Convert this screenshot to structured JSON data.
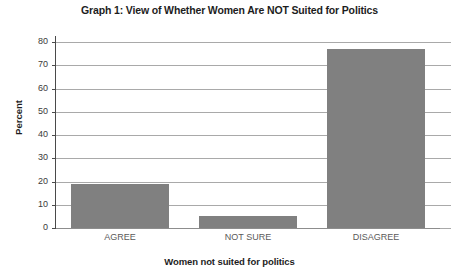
{
  "chart_data": {
    "type": "bar",
    "title": "Graph 1: View of Whether Women Are NOT Suited for Politics",
    "xlabel": "Women not suited for politics",
    "ylabel": "Percent",
    "categories": [
      "AGREE",
      "NOT SURE",
      "DISAGREE"
    ],
    "values": [
      19,
      5,
      77
    ],
    "ylim": [
      0,
      80
    ],
    "yticks": [
      0,
      10,
      20,
      30,
      40,
      50,
      60,
      70,
      80
    ],
    "ytick_labels": [
      "0",
      "10",
      "20",
      "30",
      "40",
      "50",
      "60",
      "70",
      "80"
    ],
    "grid": true,
    "legend": false,
    "bar_color": "#808080",
    "gridline_color": "#a9a9a9",
    "axis_color": "#4a4a4a",
    "background_color": "#ffffff"
  }
}
